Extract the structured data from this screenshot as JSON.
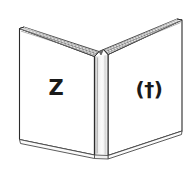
{
  "illustration": {
    "title": "Open book line drawing",
    "subject": "open-book",
    "view": "front-open",
    "style": "pen-and-ink line art with hatched page edges",
    "background_color": "#ffffff",
    "ink_color": "#1a1a1a",
    "outline_color": "#2b2b2b",
    "hatch_color": "#6e6e6e",
    "shading_color": "#cfcfcf"
  },
  "book": {
    "left_page": {
      "name": "left-page",
      "symbol": "Z",
      "symbol_name": "letter-z",
      "symbol_color": "#1a1a1a"
    },
    "right_page": {
      "name": "right-page",
      "symbol": "(†)",
      "symbol_name": "dagger-in-parentheses",
      "symbol_color": "#1a1a1a"
    },
    "spine": {
      "name": "book-spine",
      "label": ""
    },
    "top_edge": {
      "name": "page-top-edge",
      "label": ""
    },
    "bottom_edge": {
      "name": "page-bottom-edge",
      "label": ""
    }
  }
}
